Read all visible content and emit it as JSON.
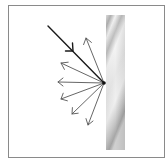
{
  "diagram": {
    "title": "",
    "type": "diffuse-reflection",
    "colors": {
      "frame": "#8a8a8a",
      "incident_ray": "#1a1a1a",
      "reflected_rays": "#555555",
      "surface_light": "#f0f0f0",
      "surface_dark": "#a8a8a8"
    },
    "surface": {
      "label": "",
      "x": 106,
      "y": 15,
      "width": 19,
      "height": 135
    },
    "contact_point": {
      "x": 104,
      "y": 83
    },
    "incident_ray": {
      "from": {
        "x": 48,
        "y": 26
      },
      "to": {
        "x": 104,
        "y": 83
      }
    },
    "reflected_rays": [
      {
        "to": {
          "x": 86,
          "y": 38
        }
      },
      {
        "to": {
          "x": 61,
          "y": 63
        }
      },
      {
        "to": {
          "x": 58,
          "y": 82
        }
      },
      {
        "to": {
          "x": 61,
          "y": 99
        }
      },
      {
        "to": {
          "x": 72,
          "y": 114
        }
      },
      {
        "to": {
          "x": 88,
          "y": 125
        }
      }
    ]
  }
}
